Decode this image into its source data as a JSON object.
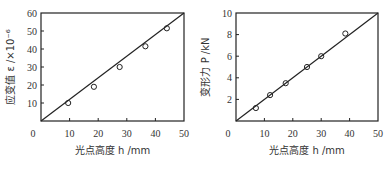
{
  "chart_data": [
    {
      "type": "scatter",
      "title": "",
      "xlabel": "光点高度 h /mm",
      "ylabel": "应变值 ε /×10⁻⁶",
      "xlim": [
        0,
        50
      ],
      "ylim": [
        0,
        60
      ],
      "xticks": [
        0,
        10,
        20,
        30,
        40,
        50
      ],
      "yticks": [
        10,
        20,
        30,
        40,
        50,
        60
      ],
      "grid": false,
      "legend": null,
      "series": [
        {
          "name": "measured",
          "marker": "open-circle",
          "x": [
            9.5,
            18.5,
            27.5,
            36.5,
            44
          ],
          "y": [
            10,
            19,
            30,
            41.5,
            51.5
          ]
        },
        {
          "name": "fit",
          "style": "line",
          "x": [
            0,
            50
          ],
          "y": [
            0,
            60
          ]
        }
      ]
    },
    {
      "type": "scatter",
      "title": "",
      "xlabel": "光点高度 h /mm",
      "ylabel": "变形力 P /kN",
      "xlim": [
        0,
        50
      ],
      "ylim": [
        0,
        10
      ],
      "xticks": [
        0,
        10,
        20,
        30,
        40,
        50
      ],
      "yticks": [
        2,
        4,
        6,
        8,
        10
      ],
      "grid": false,
      "legend": null,
      "series": [
        {
          "name": "measured",
          "marker": "open-circle",
          "x": [
            7,
            12,
            17.5,
            25,
            30,
            38.5
          ],
          "y": [
            1.2,
            2.4,
            3.5,
            5.0,
            6.0,
            8.1
          ]
        },
        {
          "name": "fit",
          "style": "line",
          "x": [
            0,
            50
          ],
          "y": [
            0,
            10
          ]
        }
      ]
    }
  ]
}
